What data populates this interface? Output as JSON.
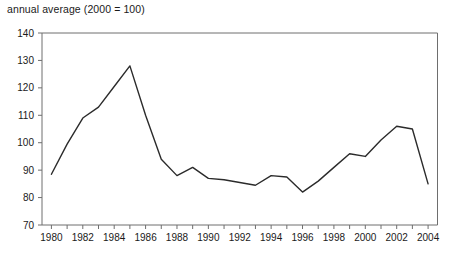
{
  "chart_data": {
    "type": "line",
    "title": "annual average (2000 = 100)",
    "xlabel": "",
    "ylabel": "",
    "x": [
      1980,
      1981,
      1982,
      1983,
      1984,
      1985,
      1986,
      1987,
      1988,
      1989,
      1990,
      1991,
      1992,
      1993,
      1994,
      1995,
      1996,
      1997,
      1998,
      1999,
      2000,
      2001,
      2002,
      2003,
      2004
    ],
    "values": [
      88.5,
      99.5,
      109,
      113,
      120.5,
      128,
      110,
      94,
      88,
      91,
      87,
      86.5,
      85.5,
      84.5,
      88,
      87.5,
      82,
      86,
      91,
      96,
      95,
      101,
      106,
      105,
      85
    ],
    "xlim": [
      1979.4,
      2004.6
    ],
    "ylim": [
      70,
      140
    ],
    "x_ticks": [
      1980,
      1981,
      1982,
      1983,
      1984,
      1985,
      1986,
      1987,
      1988,
      1989,
      1990,
      1991,
      1992,
      1993,
      1994,
      1995,
      1996,
      1997,
      1998,
      1999,
      2000,
      2001,
      2002,
      2003,
      2004
    ],
    "x_tick_labels": [
      "1980",
      "",
      "1982",
      "",
      "1984",
      "",
      "1986",
      "",
      "1988",
      "",
      "1990",
      "",
      "1992",
      "",
      "1994",
      "",
      "1996",
      "",
      "1998",
      "",
      "2000",
      "",
      "2002",
      "",
      "2004"
    ],
    "y_ticks": [
      70,
      80,
      90,
      100,
      110,
      120,
      130,
      140
    ],
    "y_tick_labels": [
      "70",
      "80",
      "90",
      "100",
      "110",
      "120",
      "130",
      "140"
    ],
    "grid": false,
    "legend": null,
    "series": [
      {
        "name": "annual average index",
        "color": "#2b2b2b",
        "line_width": 1.4,
        "values": [
          88.5,
          99.5,
          109,
          113,
          120.5,
          128,
          110,
          94,
          88,
          91,
          87,
          86.5,
          85.5,
          84.5,
          88,
          87.5,
          82,
          86,
          91,
          96,
          95,
          101,
          106,
          105,
          85
        ]
      }
    ],
    "colors": {
      "line": "#2b2b2b",
      "axis": "#6e6e6e",
      "text": "#1a1a1a",
      "background": "#ffffff"
    }
  }
}
